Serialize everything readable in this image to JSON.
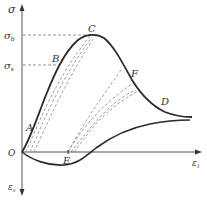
{
  "diagram": {
    "type": "stress-strain curve",
    "axes": {
      "y_label": "σ",
      "x_label": "ε",
      "x_label_sub": "1",
      "y_neg_label": "ε",
      "y_neg_label_sub": "v",
      "origin_label": "O"
    },
    "levels": {
      "sigma_b": {
        "label": "σ",
        "sub": "b"
      },
      "sigma_s": {
        "label": "σ",
        "sub": "s"
      }
    },
    "points": {
      "A": "A",
      "B": "B",
      "C": "C",
      "D": "D",
      "E": "E",
      "F": "F"
    },
    "colors": {
      "curve": "#2a2a2a",
      "axis": "#555555",
      "dashed": "#777777",
      "text": "#333333"
    }
  }
}
